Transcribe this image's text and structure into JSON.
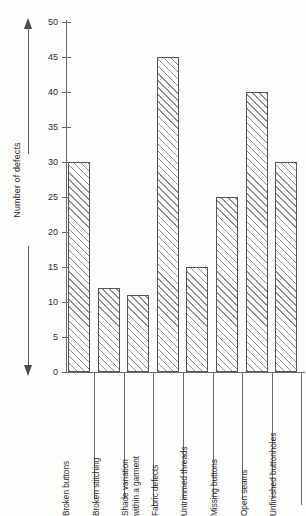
{
  "chart_data": {
    "type": "bar",
    "title": "",
    "subtitle": "",
    "xlabel": "",
    "ylabel": "Number of defects",
    "ylim": [
      0,
      50
    ],
    "ytick_step": 5,
    "yticks": [
      0,
      5,
      10,
      15,
      20,
      25,
      30,
      35,
      40,
      45,
      50
    ],
    "grid": false,
    "legend": null,
    "legend_position": "none",
    "orientation": "vertical",
    "bar_fill": "diagonal-hatch",
    "categories": [
      "Broken buttons",
      "Broken stitching",
      "Shade variation within a garment",
      "Fabric defects",
      "Untrimmed threads",
      "Missing buttons",
      "Open seams",
      "Unfinished buttonholes"
    ],
    "category_label_lines": [
      [
        "Broken buttons"
      ],
      [
        "Broken stitching"
      ],
      [
        "Shade variation",
        "within a garment"
      ],
      [
        "Fabric defects"
      ],
      [
        "Untrimmed threads"
      ],
      [
        "Missing buttons"
      ],
      [
        "Open seams"
      ],
      [
        "Unfinished buttonholes"
      ]
    ],
    "values": [
      30,
      12,
      11,
      45,
      15,
      25,
      40,
      30
    ],
    "annotations": [
      "double-headed vertical arrow beside y-axis"
    ]
  },
  "colors": {
    "ink": "#2b2b2b",
    "axis": "#6a6a6a",
    "bar_border": "#555555",
    "hatch": "#8e8e8e",
    "background": "#fdfdfb"
  },
  "axis_title": {
    "text": "Number of defects"
  }
}
